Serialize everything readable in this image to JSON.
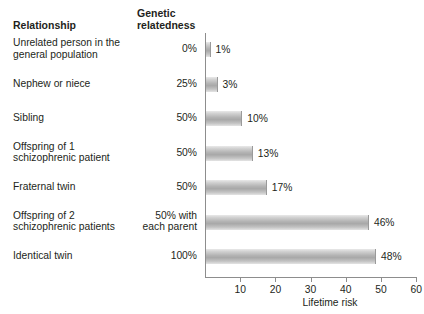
{
  "headers": {
    "relationship": "Relationship",
    "genetic_relatedness_line1": "Genetic",
    "genetic_relatedness_line2": "relatedness"
  },
  "axis": {
    "xlabel": "Lifetime risk",
    "ticks": [
      "10",
      "20",
      "30",
      "40",
      "50",
      "60"
    ],
    "xmin": 0,
    "xmax": 60
  },
  "chart_data": {
    "type": "bar",
    "orientation": "horizontal",
    "title": "",
    "xlabel": "Lifetime risk",
    "ylabel": "Relationship",
    "xlim": [
      0,
      60
    ],
    "grid": false,
    "legend": null,
    "bar_color": "#b4b4b4",
    "categories": [
      "Unrelated person in the general population",
      "Nephew or niece",
      "Sibling",
      "Offspring of 1 schizophrenic patient",
      "Fraternal twin",
      "Offspring of 2 schizophrenic patients",
      "Identical twin"
    ],
    "values": [
      1,
      3,
      10,
      13,
      17,
      46,
      48
    ],
    "value_labels": [
      "1%",
      "3%",
      "10%",
      "13%",
      "17%",
      "46%",
      "48%"
    ],
    "genetic_relatedness": [
      "0%",
      "25%",
      "50%",
      "50%",
      "50%",
      "50% with each parent",
      "100%"
    ]
  },
  "rows": [
    {
      "label_line1": "Unrelated person in the",
      "label_line2": "general population",
      "relatedness_line1": "0%",
      "relatedness_line2": "",
      "value_label": "1%",
      "value": 1
    },
    {
      "label_line1": "Nephew or niece",
      "label_line2": "",
      "relatedness_line1": "25%",
      "relatedness_line2": "",
      "value_label": "3%",
      "value": 3
    },
    {
      "label_line1": "Sibling",
      "label_line2": "",
      "relatedness_line1": "50%",
      "relatedness_line2": "",
      "value_label": "10%",
      "value": 10
    },
    {
      "label_line1": "Offspring of 1",
      "label_line2": "schizophrenic patient",
      "relatedness_line1": "50%",
      "relatedness_line2": "",
      "value_label": "13%",
      "value": 13
    },
    {
      "label_line1": "Fraternal twin",
      "label_line2": "",
      "relatedness_line1": "50%",
      "relatedness_line2": "",
      "value_label": "17%",
      "value": 17
    },
    {
      "label_line1": "Offspring of 2",
      "label_line2": "schizophrenic patients",
      "relatedness_line1": "50% with",
      "relatedness_line2": "each parent",
      "value_label": "46%",
      "value": 46
    },
    {
      "label_line1": "Identical twin",
      "label_line2": "",
      "relatedness_line1": "100%",
      "relatedness_line2": "",
      "value_label": "48%",
      "value": 48
    }
  ]
}
